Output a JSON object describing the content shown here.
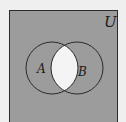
{
  "diagram": {
    "type": "venn",
    "universe_label": "U",
    "sets": [
      {
        "label": "A"
      },
      {
        "label": "B"
      }
    ],
    "shaded_region": "complement of A ∩ B",
    "unshaded_region": "A ∩ B",
    "colors": {
      "background": "#efefef",
      "shade": "#9c9c9c",
      "unshaded": "#f4f4f4",
      "stroke": "#2a2a2a"
    }
  }
}
